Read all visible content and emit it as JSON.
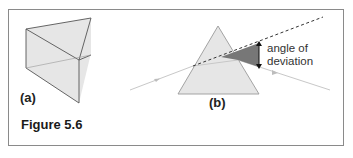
{
  "figure": {
    "caption": "Figure 5.6",
    "panels": [
      {
        "id": "a",
        "label": "(a)",
        "description": "3D triangular prism"
      },
      {
        "id": "b",
        "label": "(b)",
        "description": "Light ray refracted through a triangular prism"
      }
    ],
    "annotation": {
      "line1": "angle of",
      "line2": "deviation"
    },
    "colors": {
      "prism_fill": "#e6e6e6",
      "prism_edge": "#555555",
      "ray": "#c8c8c8",
      "deviation_wedge": "#777777",
      "frame": "#8a8a8a"
    }
  }
}
